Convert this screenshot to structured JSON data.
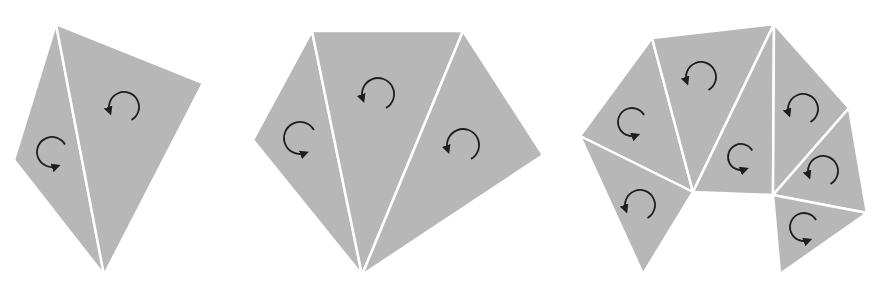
{
  "colors": {
    "background": "#ffffff",
    "fill": "#b7b7b7",
    "edge": "#ffffff",
    "arrow": "#1e1e1e"
  },
  "figures": [
    {
      "name": "quadrilateral-two-triangles",
      "triangles": [
        {
          "points": [
            [
              56,
              24
            ],
            [
              104,
              275
            ],
            [
              14,
              160
            ]
          ],
          "arrow": {
            "cx": 52,
            "cy": 152,
            "r": 15,
            "dir": "cw"
          }
        },
        {
          "points": [
            [
              56,
              24
            ],
            [
              203,
              83
            ],
            [
              104,
              275
            ]
          ],
          "arrow": {
            "cx": 124,
            "cy": 107,
            "r": 15,
            "dir": "ccw"
          }
        }
      ]
    },
    {
      "name": "pentagon-three-triangles",
      "triangles": [
        {
          "points": [
            [
              312,
              31
            ],
            [
              362,
              275
            ],
            [
              253,
              140
            ]
          ],
          "arrow": {
            "cx": 300,
            "cy": 138,
            "r": 16,
            "dir": "cw"
          }
        },
        {
          "points": [
            [
              312,
              31
            ],
            [
              463,
              31
            ],
            [
              362,
              275
            ]
          ],
          "arrow": {
            "cx": 378,
            "cy": 94,
            "r": 16,
            "dir": "ccw"
          }
        },
        {
          "points": [
            [
              463,
              31
            ],
            [
              543,
              155
            ],
            [
              362,
              275
            ]
          ],
          "arrow": {
            "cx": 463,
            "cy": 145,
            "r": 16,
            "dir": "ccw"
          }
        }
      ]
    },
    {
      "name": "arc-polygon-seven-triangles",
      "triangles": [
        {
          "points": [
            [
              580,
              136
            ],
            [
              652,
              38
            ],
            [
              693,
              192
            ]
          ],
          "arrow": {
            "cx": 632,
            "cy": 122,
            "r": 14,
            "dir": "cw"
          }
        },
        {
          "points": [
            [
              652,
              38
            ],
            [
              774,
              24
            ],
            [
              693,
              192
            ]
          ],
          "arrow": {
            "cx": 701,
            "cy": 77,
            "r": 15,
            "dir": "ccw"
          }
        },
        {
          "points": [
            [
              774,
              24
            ],
            [
              773,
              195
            ],
            [
              693,
              192
            ]
          ],
          "arrow": {
            "cx": 741,
            "cy": 157,
            "r": 13,
            "dir": "cw"
          }
        },
        {
          "points": [
            [
              774,
              24
            ],
            [
              849,
              108
            ],
            [
              773,
              195
            ]
          ],
          "arrow": {
            "cx": 803,
            "cy": 109,
            "r": 15,
            "dir": "ccw"
          }
        },
        {
          "points": [
            [
              849,
              108
            ],
            [
              867,
              213
            ],
            [
              773,
              195
            ]
          ],
          "arrow": {
            "cx": 823,
            "cy": 171,
            "r": 15,
            "dir": "ccw"
          }
        },
        {
          "points": [
            [
              773,
              195
            ],
            [
              867,
              213
            ],
            [
              780,
              274
            ]
          ],
          "arrow": {
            "cx": 804,
            "cy": 227,
            "r": 14,
            "dir": "cw"
          }
        },
        {
          "points": [
            [
              580,
              136
            ],
            [
              693,
              192
            ],
            [
              643,
              274
            ]
          ],
          "arrow": {
            "cx": 640,
            "cy": 205,
            "r": 15,
            "dir": "ccw"
          }
        }
      ]
    }
  ]
}
